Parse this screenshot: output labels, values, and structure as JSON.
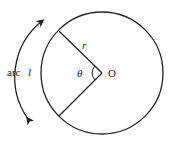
{
  "diagram": {
    "type": "circle-sector-arc-length",
    "labels": {
      "center": "O",
      "radius": "r",
      "angle": "θ",
      "arc_prefix": "arc",
      "arc_var": "l"
    },
    "colors": {
      "stroke": "#222222",
      "background": "#ffffff"
    }
  }
}
